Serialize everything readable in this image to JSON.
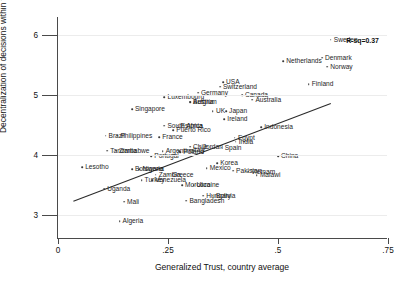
{
  "chart_data": {
    "type": "scatter",
    "title": "",
    "xlabel": "Generalized Trust, country average",
    "ylabel": "Decentralization of decisions within firms",
    "xlim": [
      0,
      0.75
    ],
    "ylim": [
      2.6,
      6.3
    ],
    "xticks": [
      "0",
      ".25",
      ".5",
      ".75"
    ],
    "xtick_values": [
      0,
      0.25,
      0.5,
      0.75
    ],
    "yticks": [
      "3",
      "4",
      "5",
      "6"
    ],
    "ytick_values": [
      3,
      4,
      5,
      6
    ],
    "grid": false,
    "legend": "none",
    "annotations": [
      {
        "text": "R-sq=0.37",
        "x": 0.655,
        "y": 5.92
      }
    ],
    "fit_line": {
      "label": "linear fit",
      "x0": 0.035,
      "y0": 3.23,
      "x1": 0.62,
      "y1": 4.86
    },
    "points": [
      {
        "label": "Sweden",
        "x": 0.62,
        "y": 5.92
      },
      {
        "label": "Denmark",
        "x": 0.6,
        "y": 5.62
      },
      {
        "label": "Netherlands",
        "x": 0.512,
        "y": 5.56
      },
      {
        "label": "Norway",
        "x": 0.612,
        "y": 5.47
      },
      {
        "label": "Finland",
        "x": 0.57,
        "y": 5.18
      },
      {
        "label": "USA",
        "x": 0.375,
        "y": 5.21
      },
      {
        "label": "Switzerland",
        "x": 0.368,
        "y": 5.14
      },
      {
        "label": "Canada",
        "x": 0.418,
        "y": 5.0
      },
      {
        "label": "Australia",
        "x": 0.442,
        "y": 4.92
      },
      {
        "label": "Germany",
        "x": 0.318,
        "y": 5.04
      },
      {
        "label": "Luxembourg",
        "x": 0.242,
        "y": 4.96
      },
      {
        "label": "Belgium",
        "x": 0.3,
        "y": 4.89
      },
      {
        "label": "Austria",
        "x": 0.3,
        "y": 4.88
      },
      {
        "label": "UK",
        "x": 0.352,
        "y": 4.73
      },
      {
        "label": "Japan",
        "x": 0.382,
        "y": 4.73
      },
      {
        "label": "Ireland",
        "x": 0.378,
        "y": 4.6
      },
      {
        "label": "Singapore",
        "x": 0.168,
        "y": 4.76
      },
      {
        "label": "South Africa",
        "x": 0.242,
        "y": 4.49
      },
      {
        "label": "Estonia",
        "x": 0.272,
        "y": 4.49
      },
      {
        "label": "Puerto Rico",
        "x": 0.262,
        "y": 4.41
      },
      {
        "label": "Indonesia",
        "x": 0.462,
        "y": 4.46
      },
      {
        "label": "Brazil",
        "x": 0.108,
        "y": 4.32
      },
      {
        "label": "Philippines",
        "x": 0.135,
        "y": 4.32
      },
      {
        "label": "France",
        "x": 0.23,
        "y": 4.3
      },
      {
        "label": "Egypt",
        "x": 0.402,
        "y": 4.29
      },
      {
        "label": "India",
        "x": 0.404,
        "y": 4.22
      },
      {
        "label": "Chile",
        "x": 0.3,
        "y": 4.14
      },
      {
        "label": "Jordan",
        "x": 0.322,
        "y": 4.14
      },
      {
        "label": "Italy",
        "x": 0.3,
        "y": 4.09
      },
      {
        "label": "Spain",
        "x": 0.372,
        "y": 4.12
      },
      {
        "label": "Tanzania",
        "x": 0.112,
        "y": 4.07
      },
      {
        "label": "Zimbabwe",
        "x": 0.132,
        "y": 4.07
      },
      {
        "label": "Argentina",
        "x": 0.238,
        "y": 4.06
      },
      {
        "label": "Finland2",
        "x": 0.276,
        "y": 4.06
      },
      {
        "label": "Poland",
        "x": 0.278,
        "y": 4.05
      },
      {
        "label": "Portugal",
        "x": 0.212,
        "y": 3.98
      },
      {
        "label": "China",
        "x": 0.5,
        "y": 3.98
      },
      {
        "label": "Lesotho",
        "x": 0.055,
        "y": 3.8
      },
      {
        "label": "Botswana",
        "x": 0.168,
        "y": 3.76
      },
      {
        "label": "Nigeria",
        "x": 0.185,
        "y": 3.76
      },
      {
        "label": "Mexico",
        "x": 0.338,
        "y": 3.78
      },
      {
        "label": "Korea",
        "x": 0.362,
        "y": 3.86
      },
      {
        "label": "Pakistan",
        "x": 0.398,
        "y": 3.74
      },
      {
        "label": "Vietnam",
        "x": 0.432,
        "y": 3.72
      },
      {
        "label": "Malawi",
        "x": 0.452,
        "y": 3.66
      },
      {
        "label": "Zambia",
        "x": 0.222,
        "y": 3.67
      },
      {
        "label": "Greece",
        "x": 0.252,
        "y": 3.67
      },
      {
        "label": "Turkey",
        "x": 0.19,
        "y": 3.58
      },
      {
        "label": "Venezuela",
        "x": 0.214,
        "y": 3.58
      },
      {
        "label": "Morocco",
        "x": 0.282,
        "y": 3.5
      },
      {
        "label": "Ukraine",
        "x": 0.308,
        "y": 3.5
      },
      {
        "label": "Uganda",
        "x": 0.105,
        "y": 3.44
      },
      {
        "label": "Hungary",
        "x": 0.33,
        "y": 3.32
      },
      {
        "label": "Bolivia",
        "x": 0.352,
        "y": 3.32
      },
      {
        "label": "Mali",
        "x": 0.15,
        "y": 3.22
      },
      {
        "label": "Bangladesh",
        "x": 0.292,
        "y": 3.24
      },
      {
        "label": "Algeria",
        "x": 0.14,
        "y": 2.9
      }
    ],
    "label_offsets": [
      {
        "label": "Sweden",
        "dx": 3,
        "dy": 0
      },
      {
        "label": "Denmark",
        "dx": 3,
        "dy": 0
      },
      {
        "label": "Netherlands",
        "dx": 3,
        "dy": 0
      },
      {
        "label": "Norway",
        "dx": 3,
        "dy": 0
      },
      {
        "label": "Finland",
        "dx": 3,
        "dy": 0
      },
      {
        "label": "USA",
        "dx": 3,
        "dy": 0
      },
      {
        "label": "Switzerland",
        "dx": 3,
        "dy": 0
      }
    ],
    "colors": {
      "point": "#3a3a3a",
      "line": "#2b2b2b",
      "axis": "#4a4a4a",
      "text": "#1a1a1a",
      "background": "#ffffff"
    }
  }
}
